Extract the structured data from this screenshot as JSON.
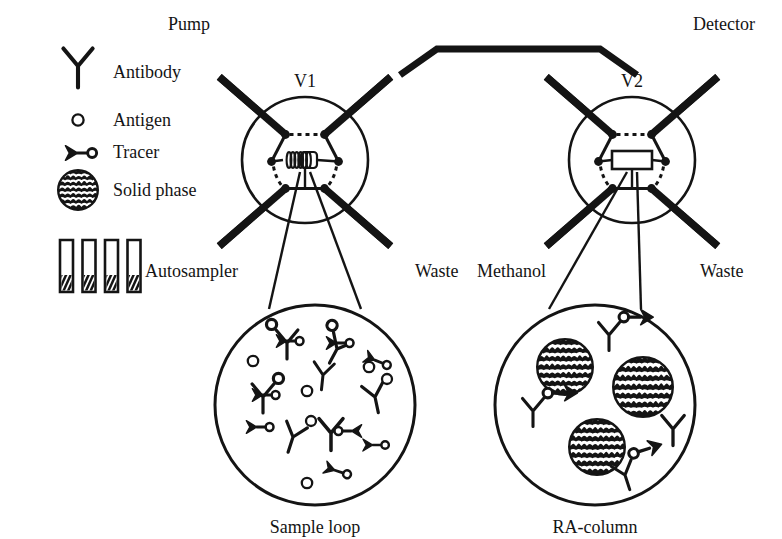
{
  "figure": {
    "background_color": "#ffffff",
    "ink_color": "#141414"
  },
  "legend": {
    "items": [
      {
        "icon": "antibody-y-icon",
        "label": "Antibody"
      },
      {
        "icon": "antigen-circle-icon",
        "label": "Antigen"
      },
      {
        "icon": "tracer-arrow-icon",
        "label": "Tracer"
      },
      {
        "icon": "solid-phase-bead-icon",
        "label": "Solid phase"
      }
    ]
  },
  "vial_rack": {
    "name": "sample-vials",
    "count": 4
  },
  "valves": [
    {
      "id": "V1",
      "label": "V1",
      "center": {
        "x": 305,
        "y": 160
      },
      "radius": 63,
      "internal_element": "coil",
      "internal_element_name": "sample-loop-coil",
      "ports": 6,
      "connections": [
        {
          "name": "pump",
          "label": "Pump",
          "corner": "top-left"
        },
        {
          "name": "transfer-line",
          "label": "",
          "corner": "top-right"
        },
        {
          "name": "autosampler",
          "label": "Autosampler",
          "corner": "bottom-left"
        },
        {
          "name": "waste-1",
          "label": "Waste",
          "corner": "bottom-right"
        }
      ]
    },
    {
      "id": "V2",
      "label": "V2",
      "center": {
        "x": 632,
        "y": 160
      },
      "radius": 63,
      "internal_element": "rectangle",
      "internal_element_name": "ra-column-cartridge",
      "ports": 6,
      "connections": [
        {
          "name": "transfer-line",
          "label": "",
          "corner": "top-left"
        },
        {
          "name": "detector",
          "label": "Detector",
          "corner": "top-right"
        },
        {
          "name": "methanol",
          "label": "Methanol",
          "corner": "bottom-left"
        },
        {
          "name": "waste-2",
          "label": "Waste",
          "corner": "bottom-right"
        }
      ]
    }
  ],
  "labels": {
    "pump": "Pump",
    "detector": "Detector",
    "autosampler": "Autosampler",
    "methanol": "Methanol",
    "waste_left": "Waste",
    "waste_right": "Waste",
    "valve1": "V1",
    "valve2": "V2"
  },
  "detail_views": [
    {
      "name": "sample-loop-detail",
      "caption": "Sample loop",
      "center": {
        "x": 315,
        "y": 405
      },
      "radius": 100,
      "contents": {
        "antibodies": 5,
        "free_antigens": 4,
        "tracers": 5,
        "antibody_antigen_complexes": 3,
        "antibody_tracer_complexes": 1,
        "solid_phase_beads": 0
      }
    },
    {
      "name": "ra-column-detail",
      "caption": "RA-column",
      "center": {
        "x": 595,
        "y": 405
      },
      "radius": 100,
      "contents": {
        "antibodies": 4,
        "free_antigens": 0,
        "tracers": 0,
        "antibody_antigen_complexes": 0,
        "antibody_tracer_complexes": 3,
        "solid_phase_beads": 3
      }
    }
  ]
}
